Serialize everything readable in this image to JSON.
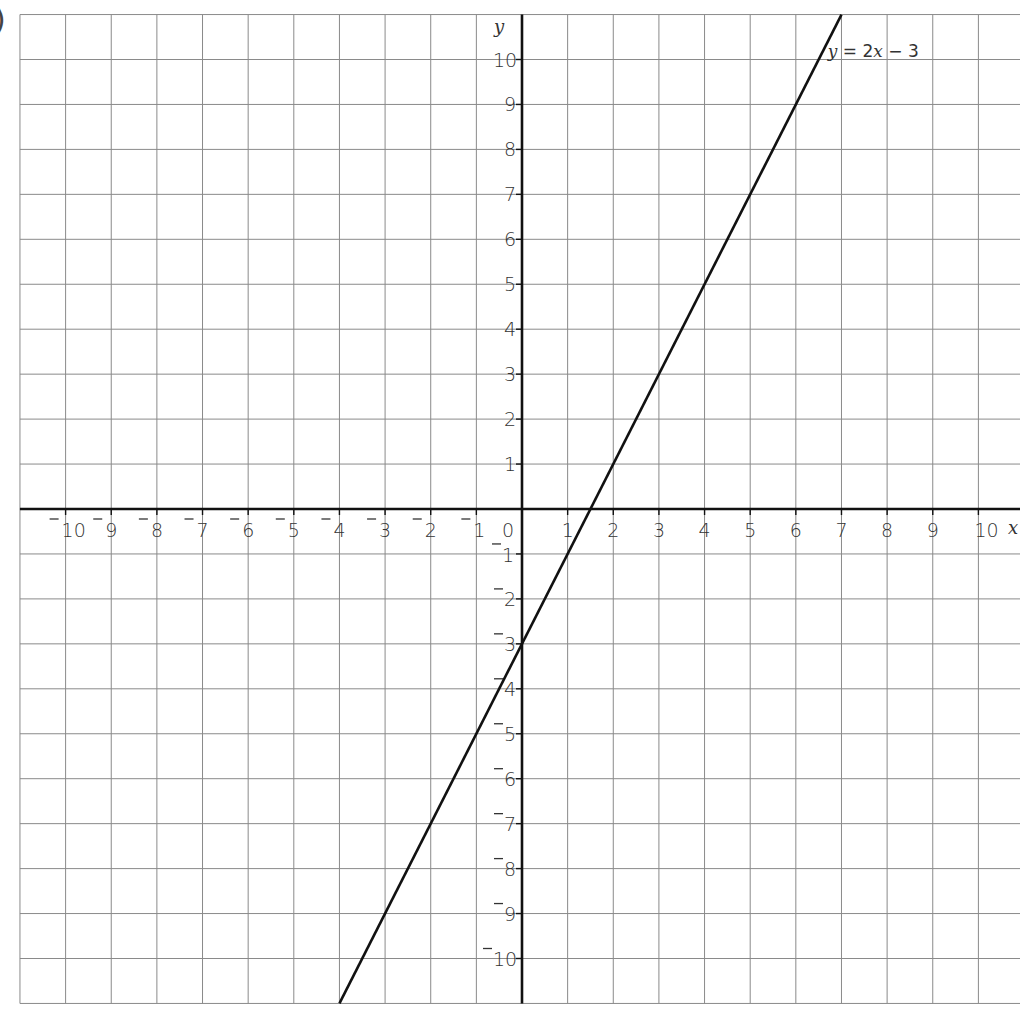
{
  "chart_data": {
    "type": "line",
    "title": "",
    "xlabel": "x",
    "ylabel": "y",
    "xlim": [
      -11,
      11
    ],
    "ylim": [
      -11,
      11
    ],
    "grid": true,
    "x_ticks": [
      -10,
      -9,
      -8,
      -7,
      -6,
      -5,
      -4,
      -3,
      -2,
      -1,
      0,
      1,
      2,
      3,
      4,
      5,
      6,
      7,
      8,
      9,
      10
    ],
    "y_ticks": [
      -10,
      -9,
      -8,
      -7,
      -6,
      -5,
      -4,
      -3,
      -2,
      -1,
      1,
      2,
      3,
      4,
      5,
      6,
      7,
      8,
      9,
      10
    ],
    "negative_style": "raised-minus",
    "series": [
      {
        "name": "y = 2x − 3",
        "equation": {
          "slope": 2,
          "intercept": -3
        },
        "x": [
          -4,
          7
        ],
        "y": [
          -11,
          11
        ],
        "color": "#111111"
      }
    ],
    "annotations": [
      {
        "text_parts": [
          "y",
          " = 2",
          "x",
          " − 3"
        ],
        "at": {
          "x": 6.7,
          "y": 10.2
        }
      }
    ],
    "crop_fragment": ")"
  }
}
